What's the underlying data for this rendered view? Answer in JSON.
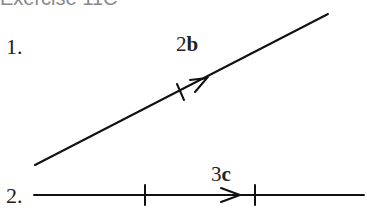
{
  "title": "Exercise 11C",
  "items": [
    {
      "number": "1.",
      "label_coef": "2",
      "label_vec": "b"
    },
    {
      "number": "2.",
      "label_coef": "3",
      "label_vec": "c"
    }
  ]
}
